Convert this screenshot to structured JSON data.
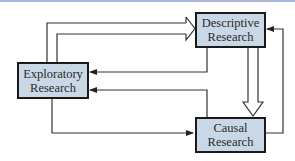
{
  "diagram": {
    "nodes": {
      "descriptive": {
        "line1": "Descriptive",
        "line2": "Research"
      },
      "exploratory": {
        "line1": "Exploratory",
        "line2": "Research"
      },
      "causal": {
        "line1": "Causal",
        "line2": "Research"
      }
    },
    "edges": [
      {
        "from": "exploratory",
        "to": "descriptive",
        "style": "hollow"
      },
      {
        "from": "exploratory",
        "to": "descriptive",
        "style": "hollow"
      },
      {
        "from": "descriptive",
        "to": "exploratory",
        "style": "solid"
      },
      {
        "from": "causal",
        "to": "exploratory",
        "style": "solid"
      },
      {
        "from": "exploratory",
        "to": "causal",
        "style": "solid"
      },
      {
        "from": "descriptive",
        "to": "causal",
        "style": "hollow-thick"
      },
      {
        "from": "causal",
        "to": "descriptive",
        "style": "solid"
      }
    ],
    "colors": {
      "box_fill": "#c9d8e6",
      "box_border": "#1a1a1a",
      "line": "#333333",
      "top_rule": "#a9b8d8"
    }
  }
}
